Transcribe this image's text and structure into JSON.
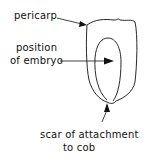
{
  "diagram": {
    "labels": {
      "pericarp": "pericarp",
      "embryo_line1": "position",
      "embryo_line2": "of embryo",
      "scar_line1": "scar of attachment",
      "scar_line2": "to cob"
    },
    "colors": {
      "line": "#111111",
      "background": "#ffffff"
    }
  }
}
